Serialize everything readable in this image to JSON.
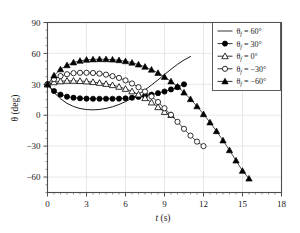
{
  "figure": {
    "background_color": "#ffffff",
    "axis_color": "#4d4d4d",
    "grid_color": "#d9d9d9",
    "series_color": "#000000"
  },
  "axes": {
    "x_title_symbol": "t",
    "x_title_unit": "(s)",
    "y_title_symbol": "θ",
    "y_title_unit": "(deg)",
    "x_ticks": [
      "0",
      "3",
      "6",
      "9",
      "12",
      "15",
      "18"
    ],
    "y_ticks": [
      "90",
      "60",
      "30",
      "0",
      "−30",
      "−60"
    ]
  },
  "legend": {
    "entries": [
      {
        "label": "θ",
        "sub": "f",
        "value": " = 60°",
        "marker": "line"
      },
      {
        "label": "θ",
        "sub": "f",
        "value": " = 30°",
        "marker": "filled-circle"
      },
      {
        "label": "θ",
        "sub": "f",
        "value": " = 0°",
        "marker": "open-triangle"
      },
      {
        "label": "θ",
        "sub": "f",
        "value": " = −30°",
        "marker": "open-circle"
      },
      {
        "label": "θ",
        "sub": "f",
        "value": " = −60°",
        "marker": "filled-triangle"
      }
    ]
  },
  "chart_data": {
    "type": "line",
    "title": "",
    "xlabel": "t (s)",
    "ylabel": "θ (deg)",
    "xlim": [
      0,
      18
    ],
    "ylim": [
      -75,
      90
    ],
    "xticks": [
      0,
      3,
      6,
      9,
      12,
      15,
      18
    ],
    "yticks": [
      90,
      60,
      30,
      0,
      -30,
      -60
    ],
    "grid": true,
    "legend_position": "top-right",
    "series": [
      {
        "name": "θf = 60°",
        "marker": "none",
        "line": "solid",
        "x": [
          0,
          0.5,
          1.0,
          1.5,
          2.0,
          2.5,
          3.0,
          3.5,
          4.0,
          4.5,
          5.0,
          5.5,
          6.0,
          6.5,
          7.0,
          7.5,
          8.0,
          8.5,
          9.0,
          9.5,
          10.0,
          10.5,
          11.0
        ],
        "y": [
          30,
          22,
          16,
          11.5,
          8.5,
          6.5,
          5.5,
          5.2,
          5.6,
          6.6,
          8.2,
          10.4,
          13.2,
          16.5,
          20.3,
          24.6,
          29.3,
          34.3,
          39.5,
          44.6,
          49.4,
          53.6,
          57.0
        ]
      },
      {
        "name": "θf = 30°",
        "marker": "filled-circle",
        "line": "solid",
        "x": [
          0,
          0.5,
          1.0,
          1.5,
          2.0,
          2.5,
          3.0,
          3.5,
          4.0,
          4.5,
          5.0,
          5.5,
          6.0,
          6.5,
          7.0,
          7.5,
          8.0,
          8.5,
          9.0,
          9.5,
          10.0,
          10.5
        ],
        "y": [
          30,
          23.5,
          20.0,
          18.0,
          17.0,
          16.4,
          16.1,
          16.0,
          16.0,
          16.0,
          16.0,
          16.1,
          16.4,
          17.0,
          17.8,
          18.8,
          20.0,
          21.4,
          23.0,
          25.0,
          27.2,
          30.0
        ]
      },
      {
        "name": "θf = 0°",
        "marker": "open-triangle",
        "line": "solid",
        "x": [
          0,
          0.5,
          1.0,
          1.5,
          2.0,
          2.5,
          3.0,
          3.5,
          4.0,
          4.5,
          5.0,
          5.5,
          6.0,
          6.5,
          7.0,
          7.5,
          8.0,
          8.5,
          9.0,
          9.5
        ],
        "y": [
          30,
          32.0,
          33.0,
          33.4,
          33.4,
          33.2,
          32.8,
          32.2,
          31.4,
          30.4,
          29.2,
          27.6,
          25.6,
          23.2,
          20.2,
          16.6,
          12.4,
          7.8,
          3.2,
          0.2
        ]
      },
      {
        "name": "θf = −30°",
        "marker": "open-circle",
        "line": "solid",
        "x": [
          0,
          0.5,
          1.0,
          1.5,
          2.0,
          2.5,
          3.0,
          3.5,
          4.0,
          4.5,
          5.0,
          5.5,
          6.0,
          6.5,
          7.0,
          7.5,
          8.0,
          8.5,
          9.0,
          9.5,
          10.0,
          10.5,
          11.0,
          11.5,
          12.0
        ],
        "y": [
          30,
          35.0,
          38.0,
          39.8,
          40.8,
          41.2,
          41.2,
          41.0,
          40.4,
          39.4,
          38.0,
          36.2,
          33.8,
          30.8,
          27.2,
          23.0,
          18.2,
          12.8,
          6.8,
          0.4,
          -6.4,
          -13.2,
          -19.8,
          -25.6,
          -30.0
        ]
      },
      {
        "name": "θf = −60°",
        "marker": "filled-triangle",
        "line": "solid",
        "x": [
          0,
          0.5,
          1.0,
          1.5,
          2.0,
          2.5,
          3.0,
          3.5,
          4.0,
          4.5,
          5.0,
          5.5,
          6.0,
          6.5,
          7.0,
          7.5,
          8.0,
          8.5,
          9.0,
          9.5,
          10.0,
          10.5,
          11.0,
          11.5,
          12.0,
          12.5,
          13.0,
          13.5,
          14.0,
          14.5,
          15.0,
          15.5
        ],
        "y": [
          30,
          38.5,
          44.5,
          48.5,
          51.2,
          52.8,
          53.8,
          54.2,
          54.4,
          54.3,
          54.0,
          53.4,
          52.4,
          51.0,
          49.2,
          47.0,
          44.2,
          41.0,
          37.2,
          32.8,
          27.8,
          22.0,
          15.6,
          8.6,
          1.0,
          -7.0,
          -15.5,
          -24.5,
          -34.0,
          -44.0,
          -54.0,
          -61.5
        ]
      }
    ]
  }
}
